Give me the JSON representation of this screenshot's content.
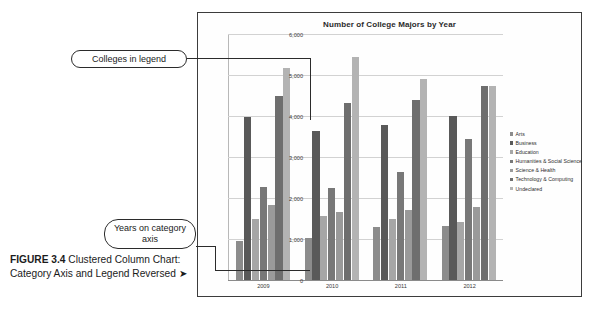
{
  "figure": {
    "label": "FIGURE 3.4",
    "caption": "Clustered Column Chart: Category Axis and Legend Reversed",
    "arrow": "➤"
  },
  "callouts": [
    {
      "id": "legend-callout",
      "text": "Colleges in legend"
    },
    {
      "id": "category-axis-callout",
      "text": "Years on category axis"
    }
  ],
  "chart_data": {
    "type": "bar",
    "title": "Number of College Majors by Year",
    "xlabel": "",
    "ylabel": "",
    "categories": [
      "2009",
      "2010",
      "2011",
      "2012"
    ],
    "ylim": [
      0,
      6000
    ],
    "yticks": [
      "0",
      "1,000",
      "2,000",
      "3,000",
      "4,000",
      "5,000",
      "6,000"
    ],
    "ytick_values": [
      0,
      1000,
      2000,
      3000,
      4000,
      5000,
      6000
    ],
    "grid": true,
    "legend_position": "right",
    "series": [
      {
        "name": "Arts",
        "color": "#8c8c8c",
        "values": [
          950,
          1020,
          1300,
          1320
        ]
      },
      {
        "name": "Business",
        "color": "#595959",
        "values": [
          3980,
          3630,
          3790,
          3990
        ]
      },
      {
        "name": "Education",
        "color": "#a6a6a6",
        "values": [
          1480,
          1560,
          1500,
          1420
        ]
      },
      {
        "name": "Humanities & Social Science",
        "color": "#787878",
        "values": [
          2280,
          2250,
          2640,
          3450
        ]
      },
      {
        "name": "Science & Health",
        "color": "#9a9a9a",
        "values": [
          1830,
          1650,
          1700,
          1780
        ]
      },
      {
        "name": "Technology & Computing",
        "color": "#6e6e6e",
        "values": [
          4480,
          4320,
          4380,
          4720
        ]
      },
      {
        "name": "Undeclared",
        "color": "#b3b3b3",
        "values": [
          5180,
          5450,
          4910,
          4740
        ]
      }
    ]
  }
}
